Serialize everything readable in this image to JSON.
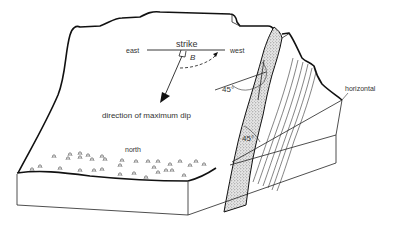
{
  "diagram": {
    "labels": {
      "strike": "strike",
      "east": "east",
      "west": "west",
      "angle_symbol": "B",
      "dip_direction": "direction of maximum dip",
      "north": "north",
      "horizontal": "horizontal",
      "angle_upper": "45°",
      "angle_lower": "45°"
    },
    "colors": {
      "line": "#111111",
      "text": "#333333",
      "stipple": "#9a9a9a",
      "background": "#ffffff"
    }
  }
}
